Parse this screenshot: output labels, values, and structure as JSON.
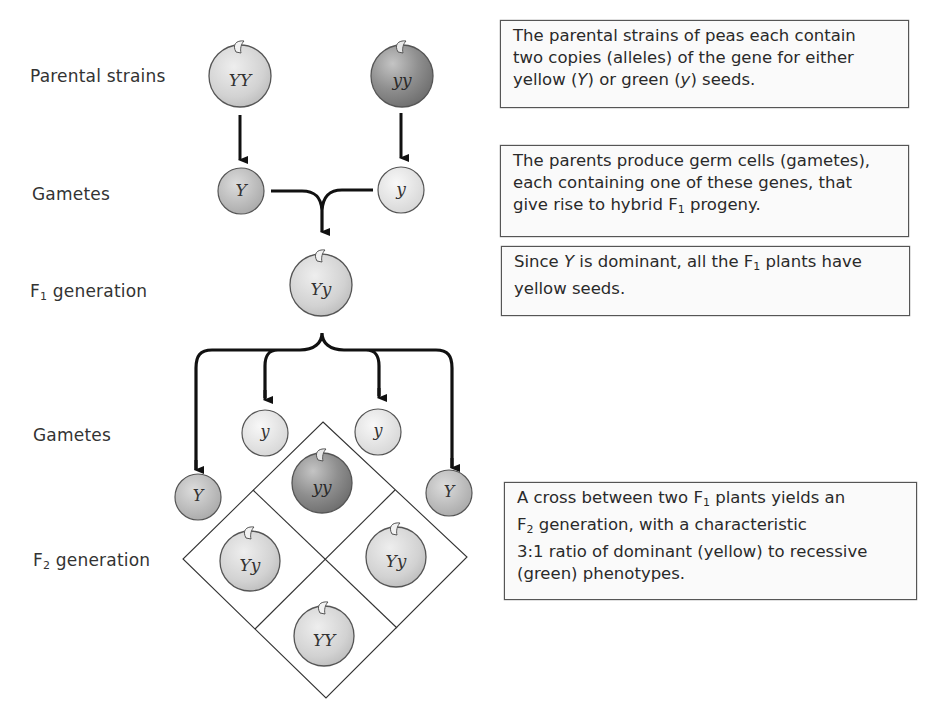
{
  "row_labels": {
    "parental": "Parental strains",
    "gametes_1": "Gametes",
    "f1": {
      "prefix": "F",
      "sub": "1",
      "suffix": " generation"
    },
    "gametes_2": "Gametes",
    "f2": {
      "prefix": "F",
      "sub": "2",
      "suffix": " generation"
    }
  },
  "colors": {
    "yellow_pea": "#d4d4d4",
    "green_pea": "#8e8e8e",
    "yellow_gamete": "#bdbdbd",
    "green_gamete": "#e6e6e6",
    "stroke": "#555555",
    "arrow": "#111111"
  },
  "peas": {
    "parent_yellow": {
      "genotype": "YY"
    },
    "parent_green": {
      "genotype": "yy"
    },
    "f1": {
      "genotype": "Yy"
    },
    "f2_top": {
      "genotype": "yy"
    },
    "f2_left": {
      "genotype": "Yy"
    },
    "f2_right": {
      "genotype": "Yy"
    },
    "f2_bottom": {
      "genotype": "YY"
    }
  },
  "gametes": {
    "row1_left": "Y",
    "row1_right": "y",
    "row2_upper_left": "y",
    "row2_upper_right": "y",
    "row2_side_left": "Y",
    "row2_side_right": "Y"
  },
  "notes": {
    "box1": {
      "l1": "The parental strains of peas each contain",
      "l2": "two copies (alleles) of the gene for either",
      "l3a": "yellow (",
      "l3Y": "Y",
      "l3b": ") or green (",
      "l3y": "y",
      "l3c": ") seeds."
    },
    "box2": {
      "l1": "The parents produce germ cells (gametes),",
      "l2": "each containing one of these genes, that",
      "l3a": "give rise to hybrid F",
      "l3sub": "1",
      "l3b": " progeny."
    },
    "box3": {
      "l1a": "Since ",
      "l1Y": "Y",
      "l1b": " is dominant, all the F",
      "l1sub": "1",
      "l1c": " plants have",
      "l2": "yellow seeds."
    },
    "box4": {
      "l1a": "A cross between two F",
      "l1sub": "1",
      "l1b": " plants yields an",
      "l2a": "F",
      "l2sub": "2",
      "l2b": " generation, with a characteristic",
      "l3": "3:1 ratio of dominant (yellow) to recessive",
      "l4": "(green) phenotypes."
    }
  }
}
